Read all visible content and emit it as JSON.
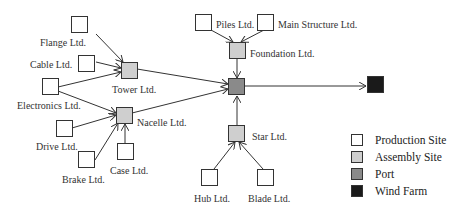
{
  "colors": {
    "production": "#ffffff",
    "assembly": "#cfcfcf",
    "port": "#8a8a8a",
    "windfarm": "#1a1a1a",
    "stroke": "#333333"
  },
  "nodes": [
    {
      "id": "flange",
      "label": "Flange Ltd.",
      "type": "production",
      "x": 71,
      "y": 16,
      "lx": 40,
      "ly": 37
    },
    {
      "id": "cable",
      "label": "Cable Ltd.",
      "type": "production",
      "x": 78,
      "y": 55,
      "lx": 30,
      "ly": 59
    },
    {
      "id": "electronics",
      "label": "Electronics Ltd.",
      "type": "production",
      "x": 42,
      "y": 78,
      "lx": 17,
      "ly": 100
    },
    {
      "id": "drive",
      "label": "Drive Ltd.",
      "type": "production",
      "x": 56,
      "y": 120,
      "lx": 36,
      "ly": 141
    },
    {
      "id": "brake",
      "label": "Brake Ltd.",
      "type": "production",
      "x": 78,
      "y": 151,
      "lx": 62,
      "ly": 174
    },
    {
      "id": "case",
      "label": "Case Ltd.",
      "type": "production",
      "x": 117,
      "y": 143,
      "lx": 110,
      "ly": 165
    },
    {
      "id": "tower",
      "label": "Tower Ltd.",
      "type": "assembly",
      "x": 121,
      "y": 62,
      "lx": 112,
      "ly": 84
    },
    {
      "id": "nacelle",
      "label": "Nacelle Ltd.",
      "type": "assembly",
      "x": 116,
      "y": 107,
      "lx": 137,
      "ly": 117
    },
    {
      "id": "piles",
      "label": "Piles Ltd.",
      "type": "production",
      "x": 195,
      "y": 14,
      "lx": 216,
      "ly": 19
    },
    {
      "id": "mainstructure",
      "label": "Main Structure Ltd.",
      "type": "production",
      "x": 257,
      "y": 14,
      "lx": 278,
      "ly": 19
    },
    {
      "id": "foundation",
      "label": "Foundation Ltd.",
      "type": "assembly",
      "x": 229,
      "y": 42,
      "lx": 250,
      "ly": 48
    },
    {
      "id": "port",
      "label": "",
      "type": "port",
      "x": 228,
      "y": 78,
      "lx": 0,
      "ly": 0
    },
    {
      "id": "star",
      "label": "Star Ltd.",
      "type": "assembly",
      "x": 228,
      "y": 125,
      "lx": 252,
      "ly": 131
    },
    {
      "id": "hub",
      "label": "Hub Ltd.",
      "type": "production",
      "x": 201,
      "y": 169,
      "lx": 194,
      "ly": 193
    },
    {
      "id": "blade",
      "label": "Blade Ltd.",
      "type": "production",
      "x": 257,
      "y": 169,
      "lx": 248,
      "ly": 193
    },
    {
      "id": "windfarm",
      "label": "",
      "type": "windfarm",
      "x": 367,
      "y": 76,
      "lx": 0,
      "ly": 0
    }
  ],
  "edges": [
    {
      "from": [
        96,
        34
      ],
      "to": [
        123,
        62
      ]
    },
    {
      "from": [
        96,
        62
      ],
      "to": [
        121,
        68
      ]
    },
    {
      "from": [
        58,
        87
      ],
      "to": [
        121,
        72
      ]
    },
    {
      "from": [
        58,
        91
      ],
      "to": [
        116,
        113
      ]
    },
    {
      "from": [
        72,
        128
      ],
      "to": [
        116,
        115
      ]
    },
    {
      "from": [
        95,
        160
      ],
      "to": [
        118,
        123
      ]
    },
    {
      "from": [
        125,
        143
      ],
      "to": [
        125,
        124
      ]
    },
    {
      "from": [
        137,
        69
      ],
      "to": [
        228,
        84
      ]
    },
    {
      "from": [
        132,
        113
      ],
      "to": [
        228,
        89
      ]
    },
    {
      "from": [
        211,
        30
      ],
      "to": [
        233,
        42
      ]
    },
    {
      "from": [
        264,
        30
      ],
      "to": [
        241,
        42
      ]
    },
    {
      "from": [
        237,
        58
      ],
      "to": [
        237,
        78
      ]
    },
    {
      "from": [
        237,
        125
      ],
      "to": [
        237,
        96
      ]
    },
    {
      "from": [
        214,
        169
      ],
      "to": [
        235,
        142
      ]
    },
    {
      "from": [
        263,
        169
      ],
      "to": [
        239,
        142
      ]
    },
    {
      "from": [
        245,
        86
      ],
      "to": [
        366,
        86
      ]
    }
  ],
  "legend": {
    "items": [
      {
        "label": "Production Site",
        "type": "production"
      },
      {
        "label": "Assembly Site",
        "type": "assembly"
      },
      {
        "label": "Port",
        "type": "port"
      },
      {
        "label": "Wind Farm",
        "type": "windfarm"
      }
    ]
  }
}
